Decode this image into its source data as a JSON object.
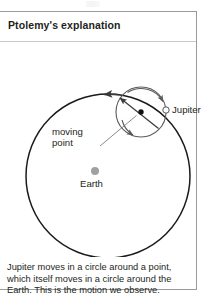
{
  "panel": {
    "title": "Ptolemy's explanation"
  },
  "diagram": {
    "labels": {
      "jupiter": "Jupiter",
      "moving_point_line1": "moving",
      "moving_point_line2": "point",
      "earth": "Earth"
    },
    "colors": {
      "deferent_stroke": "#1a1a1a",
      "epicycle_stroke": "#5a5a5a",
      "earth_dot": "#a0a0a0",
      "center_dot": "#111111",
      "leader_line": "#6e6e6e",
      "text": "#231f20"
    },
    "geometry": {
      "deferent_center_x": 108,
      "deferent_center_y": 134,
      "deferent_radius": 82,
      "epicycle_center_x": 141,
      "epicycle_center_y": 70,
      "epicycle_radius": 25,
      "earth_dot_x": 95,
      "earth_dot_y": 129,
      "earth_dot_radius": 4,
      "jupiter_marker_x": 166,
      "jupiter_marker_y": 68,
      "jupiter_marker_radius": 3.2
    }
  },
  "caption": {
    "line1": "Jupiter moves in a circle around a point,",
    "line2": "which itself moves in a circle around the",
    "line3": "Earth. This is the motion we observe."
  }
}
